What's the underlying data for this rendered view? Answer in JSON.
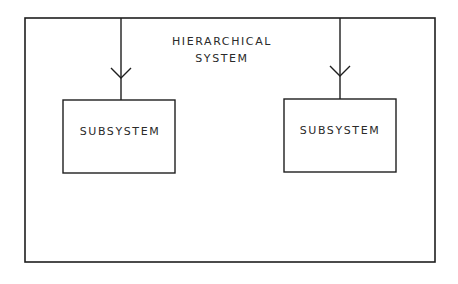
{
  "diagram": {
    "title_lines": [
      "HIERARCHICAL",
      "SYSTEM"
    ],
    "outer_container": {
      "label": "HIERARCHICAL SYSTEM",
      "box": {
        "x": 25,
        "y": 18,
        "width": 410,
        "height": 244
      }
    },
    "subsystems": [
      {
        "label": "SUBSYSTEM",
        "box": {
          "x": 63,
          "y": 100,
          "width": 112,
          "height": 73
        },
        "connector_x": 121,
        "arrow_tip_y": 78
      },
      {
        "label": "SUBSYSTEM",
        "box": {
          "x": 284,
          "y": 99,
          "width": 112,
          "height": 73
        },
        "connector_x": 340,
        "arrow_tip_y": 76
      }
    ],
    "colors": {
      "stroke": "#1e1e1e",
      "text": "#2a2a2a",
      "background": "#ffffff"
    }
  }
}
